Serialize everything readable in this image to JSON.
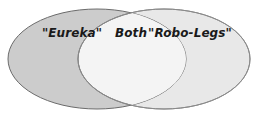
{
  "figure": {
    "type": "venn-diagram",
    "background_color": "#ffffff",
    "set_count": 2
  },
  "venn": {
    "left_set": {
      "label": "\"Eureka\"",
      "fill_color": "#cccccc",
      "stroke_color": "#6b6b6b",
      "center_x": 97,
      "center_y": 59,
      "radius_x": 89,
      "radius_y": 50
    },
    "right_set": {
      "label": "\"Robo-Legs\"",
      "fill_color": "#e8e8e8",
      "stroke_color": "#8a8a8a",
      "center_x": 164,
      "center_y": 59,
      "radius_x": 86,
      "radius_y": 50
    },
    "intersection": {
      "label": "Both",
      "fill_color": "#f4f4f4",
      "stroke_color": "#6b6b6b"
    },
    "labels": {
      "left": {
        "text": "\"Eureka\"",
        "x": 72,
        "y": 37
      },
      "middle": {
        "text": "Both",
        "x": 131,
        "y": 37
      },
      "right": {
        "text": "\"Robo-Legs\"",
        "x": 190,
        "y": 37
      }
    }
  }
}
